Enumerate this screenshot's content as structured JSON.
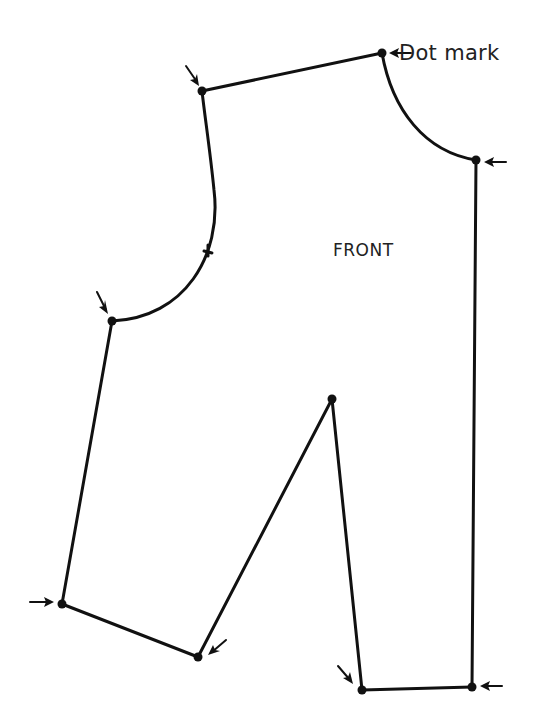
{
  "diagram": {
    "piece_label": "FRONT",
    "callout_label": "Dot mark",
    "colors": {
      "line": "#111111",
      "text": "#222222",
      "background": "#ffffff"
    },
    "dots": [
      {
        "name": "shoulder-left",
        "x": 202,
        "y": 91
      },
      {
        "name": "neck-top",
        "x": 382,
        "y": 53
      },
      {
        "name": "neck-right",
        "x": 476,
        "y": 160
      },
      {
        "name": "armhole-bottom",
        "x": 112,
        "y": 321
      },
      {
        "name": "dart-tip",
        "x": 332,
        "y": 399
      },
      {
        "name": "hem-left",
        "x": 62,
        "y": 604
      },
      {
        "name": "crotch-left",
        "x": 198,
        "y": 657
      },
      {
        "name": "crotch-right",
        "x": 362,
        "y": 690
      },
      {
        "name": "hem-right",
        "x": 472,
        "y": 687
      }
    ],
    "notch": {
      "name": "armhole-notch",
      "x": 208,
      "y": 252
    }
  }
}
